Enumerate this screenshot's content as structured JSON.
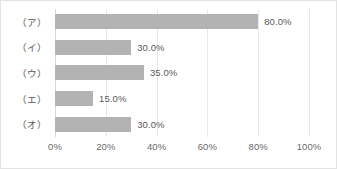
{
  "chart_data": {
    "type": "bar",
    "orientation": "horizontal",
    "title": "",
    "xlabel": "",
    "ylabel": "",
    "categories": [
      "（ア）",
      "（イ）",
      "（ウ）",
      "（エ）",
      "（オ）"
    ],
    "values": [
      80.0,
      30.0,
      35.0,
      15.0,
      30.0
    ],
    "data_labels": [
      "80.0%",
      "30.0%",
      "35.0%",
      "15.0%",
      "30.0%"
    ],
    "xlim": [
      0,
      100
    ],
    "xticks": [
      0,
      20,
      40,
      60,
      80,
      100
    ],
    "xtick_labels": [
      "0%",
      "20%",
      "40%",
      "60%",
      "80%",
      "100%"
    ],
    "grid": true,
    "legend": false,
    "colors": {
      "bar_fill": "#b3b3b3",
      "text": "#595959",
      "tick_text": "#6b6b6b",
      "gridline": "#e8e8e8",
      "axis_line": "#d9d9d9",
      "border": "#e3e3e3",
      "background": "#ffffff"
    }
  }
}
